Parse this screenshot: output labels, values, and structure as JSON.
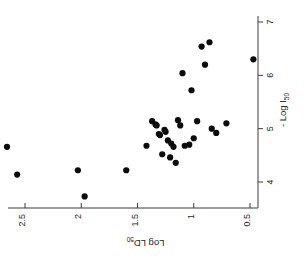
{
  "chart_data": {
    "type": "scatter",
    "title": "",
    "subtitle": "",
    "xlabel": "Log LD",
    "xlabel_subscript": "50",
    "ylabel": "- Log I",
    "ylabel_subscript": "50",
    "rotation_degrees": 90,
    "grid": false,
    "legend": "none",
    "xlim": [
      2.75,
      0.35
    ],
    "ylim": [
      3.55,
      7.15
    ],
    "x_axis_reversed": true,
    "xticks": [
      2.5,
      2,
      1.5,
      1,
      0.5
    ],
    "xtick_labels": [
      "2.5",
      "2",
      "1.5",
      "1",
      "0.5"
    ],
    "yticks": [
      4,
      5,
      6,
      7
    ],
    "ytick_labels": [
      "4",
      "5",
      "6",
      "7"
    ],
    "marker": "filled-circle",
    "marker_color": "#0c0c0c",
    "marker_size_px": 3.1,
    "n_points": 34,
    "x": [
      2.66,
      2.57,
      2.03,
      1.97,
      1.6,
      1.42,
      1.37,
      1.34,
      1.33,
      1.31,
      1.3,
      1.28,
      1.26,
      1.25,
      1.23,
      1.21,
      1.2,
      1.18,
      1.16,
      1.14,
      1.12,
      1.1,
      1.08,
      1.04,
      1.02,
      1.0,
      0.97,
      0.93,
      0.9,
      0.86,
      0.84,
      0.8,
      0.71,
      0.47
    ],
    "y": [
      4.66,
      4.14,
      4.22,
      3.73,
      4.22,
      4.68,
      5.14,
      5.08,
      5.06,
      4.9,
      4.88,
      4.52,
      4.98,
      4.94,
      4.78,
      4.46,
      4.72,
      4.66,
      4.36,
      5.16,
      5.06,
      6.04,
      4.68,
      4.7,
      5.72,
      4.82,
      5.14,
      6.54,
      6.2,
      6.62,
      5.0,
      4.92,
      5.1,
      6.3
    ],
    "points": [
      {
        "x": 2.66,
        "y": 4.66
      },
      {
        "x": 2.57,
        "y": 4.14
      },
      {
        "x": 2.03,
        "y": 4.22
      },
      {
        "x": 1.97,
        "y": 3.73
      },
      {
        "x": 1.6,
        "y": 4.22
      },
      {
        "x": 1.42,
        "y": 4.68
      },
      {
        "x": 1.37,
        "y": 5.14
      },
      {
        "x": 1.34,
        "y": 5.08
      },
      {
        "x": 1.33,
        "y": 5.06
      },
      {
        "x": 1.31,
        "y": 4.9
      },
      {
        "x": 1.3,
        "y": 4.88
      },
      {
        "x": 1.28,
        "y": 4.52
      },
      {
        "x": 1.26,
        "y": 4.98
      },
      {
        "x": 1.25,
        "y": 4.94
      },
      {
        "x": 1.23,
        "y": 4.78
      },
      {
        "x": 1.21,
        "y": 4.46
      },
      {
        "x": 1.2,
        "y": 4.72
      },
      {
        "x": 1.18,
        "y": 4.66
      },
      {
        "x": 1.16,
        "y": 4.36
      },
      {
        "x": 1.14,
        "y": 5.16
      },
      {
        "x": 1.12,
        "y": 5.06
      },
      {
        "x": 1.1,
        "y": 6.04
      },
      {
        "x": 1.08,
        "y": 4.68
      },
      {
        "x": 1.04,
        "y": 4.7
      },
      {
        "x": 1.02,
        "y": 5.72
      },
      {
        "x": 1.0,
        "y": 4.82
      },
      {
        "x": 0.97,
        "y": 5.14
      },
      {
        "x": 0.93,
        "y": 6.54
      },
      {
        "x": 0.9,
        "y": 6.2
      },
      {
        "x": 0.86,
        "y": 6.62
      },
      {
        "x": 0.84,
        "y": 5.0
      },
      {
        "x": 0.8,
        "y": 4.92
      },
      {
        "x": 0.71,
        "y": 5.1
      },
      {
        "x": 0.47,
        "y": 6.3
      }
    ]
  },
  "axes": {
    "x_axis_name": "Log LD50 axis",
    "y_axis_name": "- Log I50 axis"
  }
}
